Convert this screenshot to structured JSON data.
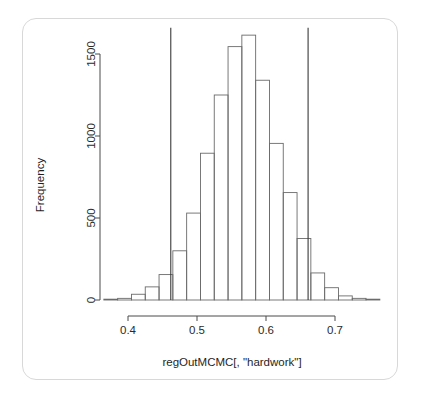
{
  "figure": {
    "background_color": "#ffffff",
    "card_border_color": "#d8d8d8",
    "axis_color": "#4a4a4a",
    "bar_border_color": "#6b6b6b",
    "bar_fill_color": "#ffffff",
    "reference_line_color": "#3a3a3a"
  },
  "chart_data": {
    "type": "bar",
    "title": "",
    "subtitle": "",
    "xlabel": "regOutMCMC[, \"hardwork\"]",
    "ylabel": "Frequency",
    "xlim": [
      0.365,
      0.765
    ],
    "ylim": [
      0,
      1650
    ],
    "xticks": [
      0.4,
      0.5,
      0.6,
      0.7
    ],
    "xtick_labels": [
      "0.4",
      "0.5",
      "0.6",
      "0.7"
    ],
    "yticks": [
      0,
      500,
      1000,
      1500
    ],
    "ytick_labels": [
      "0",
      "500",
      "1000",
      "1500"
    ],
    "grid": false,
    "legend": null,
    "bin_width": 0.02,
    "bin_edges": [
      0.365,
      0.385,
      0.405,
      0.425,
      0.445,
      0.465,
      0.485,
      0.505,
      0.525,
      0.545,
      0.565,
      0.585,
      0.605,
      0.625,
      0.645,
      0.665,
      0.685,
      0.705,
      0.725,
      0.745,
      0.765
    ],
    "categories": [
      "0.365-0.385",
      "0.385-0.405",
      "0.405-0.425",
      "0.425-0.445",
      "0.445-0.465",
      "0.465-0.485",
      "0.485-0.505",
      "0.505-0.525",
      "0.525-0.545",
      "0.545-0.565",
      "0.565-0.585",
      "0.585-0.605",
      "0.605-0.625",
      "0.625-0.645",
      "0.645-0.665",
      "0.665-0.685",
      "0.685-0.705",
      "0.705-0.725",
      "0.725-0.745",
      "0.745-0.765"
    ],
    "values": [
      5,
      10,
      35,
      80,
      155,
      300,
      530,
      895,
      1250,
      1545,
      1615,
      1340,
      955,
      655,
      375,
      165,
      75,
      25,
      10,
      5
    ],
    "annotations": [
      {
        "name": "lower-credible-interval-line",
        "type": "vline",
        "x": 0.462
      },
      {
        "name": "upper-credible-interval-line",
        "type": "vline",
        "x": 0.661
      }
    ]
  }
}
